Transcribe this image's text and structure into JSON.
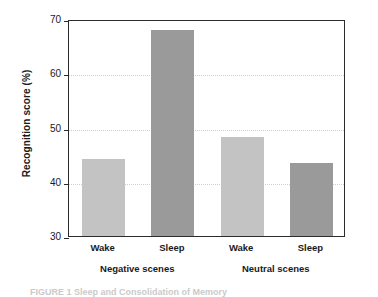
{
  "chart_data": {
    "type": "bar",
    "title": "",
    "xlabel": "",
    "ylabel": "Recognition score (%)",
    "ylim": [
      30,
      70
    ],
    "yticks": [
      30,
      40,
      50,
      60,
      70
    ],
    "ytick_labels": [
      "30",
      "40",
      "50",
      "60",
      "70"
    ],
    "grid": "horizontal-dotted",
    "legend": "none",
    "categories": [
      "Wake",
      "Sleep",
      "Wake",
      "Sleep"
    ],
    "groups": [
      "Negative scenes",
      "Neutral scenes"
    ],
    "values": [
      44.2,
      68.0,
      48.2,
      43.5
    ],
    "bars": [
      {
        "label": "Wake",
        "group": "Negative scenes",
        "value": 44.2,
        "color": "#c3c3c3"
      },
      {
        "label": "Sleep",
        "group": "Negative scenes",
        "value": 68.0,
        "color": "#9a9a9a"
      },
      {
        "label": "Wake",
        "group": "Neutral scenes",
        "value": 48.2,
        "color": "#c3c3c3"
      },
      {
        "label": "Sleep",
        "group": "Neutral scenes",
        "value": 43.5,
        "color": "#9a9a9a"
      }
    ],
    "colors": {
      "wake_bar": "#c3c3c3",
      "sleep_bar": "#9a9a9a",
      "axis": "#2b2b2b",
      "gridline": "#cfcfcf",
      "background": "#ffffff"
    }
  },
  "caption": {
    "text": "FIGURE 1 Sleep and Consolidation of Memory"
  }
}
